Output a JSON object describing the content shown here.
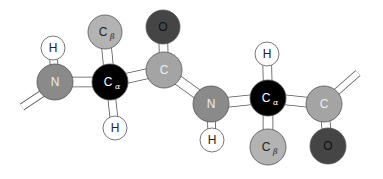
{
  "colors": {
    "N": "#8a8a8a",
    "C": "#a4a4a4",
    "Calpha": "#000000",
    "Cbeta": "#b3b3b3",
    "O": "#454545",
    "H": "#ffffff",
    "stroke": "#555555",
    "bond": "#ffffff"
  },
  "atoms": [
    {
      "id": "h1",
      "el": "H",
      "label": "H",
      "sub": "",
      "x": 53,
      "y": 48,
      "r": 12
    },
    {
      "id": "n1",
      "el": "N",
      "label": "N",
      "sub": "",
      "x": 55,
      "y": 82,
      "r": 18
    },
    {
      "id": "cb1",
      "el": "Cbeta",
      "label": "C",
      "sub": "β",
      "x": 105,
      "y": 32,
      "r": 17
    },
    {
      "id": "ca1",
      "el": "Calpha",
      "label": "C",
      "sub": "α",
      "x": 110,
      "y": 82,
      "r": 18
    },
    {
      "id": "h2",
      "el": "H",
      "label": "H",
      "sub": "",
      "x": 115,
      "y": 128,
      "r": 12
    },
    {
      "id": "o1",
      "el": "O",
      "label": "O",
      "sub": "",
      "x": 163,
      "y": 27,
      "r": 17
    },
    {
      "id": "c1",
      "el": "C",
      "label": "C",
      "sub": "",
      "x": 164,
      "y": 70,
      "r": 18
    },
    {
      "id": "n2",
      "el": "N",
      "label": "N",
      "sub": "",
      "x": 211,
      "y": 104,
      "r": 18
    },
    {
      "id": "h3",
      "el": "H",
      "label": "H",
      "sub": "",
      "x": 212,
      "y": 140,
      "r": 12
    },
    {
      "id": "h4",
      "el": "H",
      "label": "H",
      "sub": "",
      "x": 267,
      "y": 54,
      "r": 12
    },
    {
      "id": "ca2",
      "el": "Calpha",
      "label": "C",
      "sub": "α",
      "x": 268,
      "y": 98,
      "r": 18
    },
    {
      "id": "cb2",
      "el": "Cbeta",
      "label": "C",
      "sub": "β",
      "x": 268,
      "y": 147,
      "r": 18
    },
    {
      "id": "c2",
      "el": "C",
      "label": "C",
      "sub": "",
      "x": 324,
      "y": 104,
      "r": 18
    },
    {
      "id": "o2",
      "el": "O",
      "label": "O",
      "sub": "",
      "x": 328,
      "y": 146,
      "r": 18
    }
  ],
  "bonds": [
    {
      "a": "n1",
      "b": "h1",
      "w": 7
    },
    {
      "a": "n1",
      "b": "ca1",
      "w": 9
    },
    {
      "a": "ca1",
      "b": "cb1",
      "w": 9
    },
    {
      "a": "ca1",
      "b": "h2",
      "w": 7
    },
    {
      "a": "ca1",
      "b": "c1",
      "w": 9
    },
    {
      "a": "c1",
      "b": "o1",
      "w": 8
    },
    {
      "a": "c1",
      "b": "n2",
      "w": 9
    },
    {
      "a": "n2",
      "b": "h3",
      "w": 7
    },
    {
      "a": "n2",
      "b": "ca2",
      "w": 9
    },
    {
      "a": "ca2",
      "b": "h4",
      "w": 8
    },
    {
      "a": "ca2",
      "b": "cb2",
      "w": 9
    },
    {
      "a": "ca2",
      "b": "c2",
      "w": 9
    },
    {
      "a": "c2",
      "b": "o2",
      "w": 8
    }
  ],
  "stubs": [
    {
      "x1": 22,
      "y1": 107,
      "x2": 46,
      "y2": 91,
      "w": 6
    },
    {
      "x1": 333,
      "y1": 95,
      "x2": 358,
      "y2": 73,
      "w": 6
    }
  ]
}
